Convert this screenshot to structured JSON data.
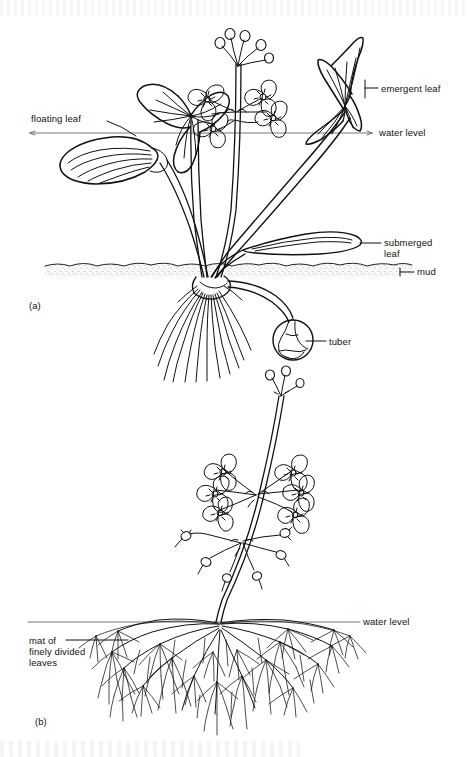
{
  "figure": {
    "background_color": "#ffffff",
    "ink_color": "#111111",
    "line_color": "#555555",
    "width": 468,
    "height": 757
  },
  "panels": [
    {
      "id": "a",
      "id_label": "(a)",
      "subject": "arrowhead-sagittaria",
      "description": "Emergent aquatic plant with three leaf forms, fibrous roots, stolon and tuber rooted in mud"
    },
    {
      "id": "b",
      "id_label": "(b)",
      "subject": "water-crowfoot-ranunculus",
      "description": "Aquatic plant with emergent flowers above water and a submerged mat of finely divided leaves"
    }
  ],
  "labels": {
    "floating_leaf": "floating leaf",
    "emergent_leaf": "emergent leaf",
    "water_level_top": "water level",
    "submerged_leaf": "submerged\nleaf",
    "mud": "mud",
    "tuber": "tuber",
    "water_level_bottom": "water level",
    "mat_of_leaves": "mat of\nfinely divided\nleaves"
  },
  "reference_lines": [
    {
      "name": "water-level-line-a",
      "y": 133,
      "x_start": 30,
      "x_end": 372
    },
    {
      "name": "mud-line",
      "y": 270,
      "x_start": 45,
      "x_end": 412
    },
    {
      "name": "water-level-line-b",
      "y": 622,
      "x_start": 28,
      "x_end": 360
    }
  ]
}
